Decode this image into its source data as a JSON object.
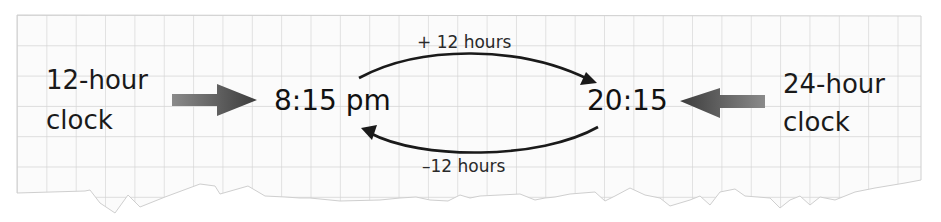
{
  "diagram": {
    "left_label": {
      "line1": "12-hour",
      "line2": "clock"
    },
    "right_label": {
      "line1": "24-hour",
      "line2": "clock"
    },
    "time_12h": "8:15 pm",
    "time_24h": "20:15",
    "top_operation": "+ 12 hours",
    "bottom_operation": "–12 hours"
  },
  "colors": {
    "grid_line": "#d4d4d4",
    "paper": "#fbfbfb",
    "text": "#1a1a1a",
    "block_arrow_dark": "#3c3c3c",
    "block_arrow_light": "#8a8a8a",
    "curve_arrow": "#1a1a1a"
  }
}
